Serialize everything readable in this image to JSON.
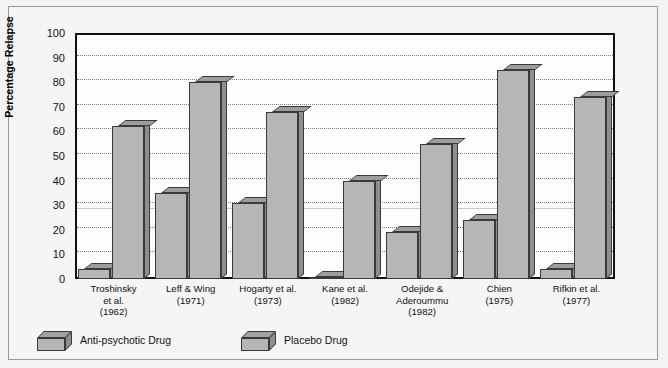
{
  "chart_data": {
    "type": "bar",
    "title": "",
    "xlabel": "",
    "ylabel": "Percentage Relapse",
    "ylim": [
      0,
      100
    ],
    "yticks": [
      0,
      10,
      20,
      30,
      40,
      50,
      60,
      70,
      80,
      90,
      100
    ],
    "grid": true,
    "legend_position": "below-plot-left",
    "categories": [
      "Troshinsky\net al.\n(1962)",
      "Leff & Wing\n(1971)",
      "Hogarty et al.\n(1973)",
      "Kane et al.\n(1982)",
      "Odejide &\nAderoummu\n(1982)",
      "Chien\n(1975)",
      "Rifkin et al.\n(1977)"
    ],
    "category_lines": [
      [
        "Troshinsky",
        "et al.",
        "(1962)"
      ],
      [
        "Leff & Wing",
        "(1971)"
      ],
      [
        "Hogarty et al.",
        "(1973)"
      ],
      [
        "Kane et al.",
        "(1982)"
      ],
      [
        "Odejide &",
        "Aderoummu",
        "(1982)"
      ],
      [
        "Chien",
        "(1975)"
      ],
      [
        "Rifkin et al.",
        "(1977)"
      ]
    ],
    "series": [
      {
        "name": "Anti-psychotic Drug",
        "values": [
          4,
          35,
          31,
          1,
          19,
          24,
          4
        ]
      },
      {
        "name": "Placebo Drug",
        "values": [
          62,
          80,
          68,
          40,
          55,
          85,
          74
        ]
      }
    ],
    "colors": {
      "bar_face": "#b6b6b6",
      "bar_top": "#9d9d9d",
      "bar_side": "#8e8e8e",
      "bar_outline": "#3a3a3a",
      "plot_background": "#fdfdfd",
      "figure_background": "#f3f3f3",
      "gridline": "#7d7d7d",
      "axis": "#111111"
    }
  },
  "legend": {
    "items": [
      {
        "label": "Anti-psychotic Drug"
      },
      {
        "label": "Placebo Drug"
      }
    ]
  },
  "axis": {
    "y_title": "Percentage Relapse",
    "y_labels": [
      "100",
      "90",
      "80",
      "70",
      "60",
      "50",
      "40",
      "30",
      "20",
      "10",
      "0"
    ]
  }
}
